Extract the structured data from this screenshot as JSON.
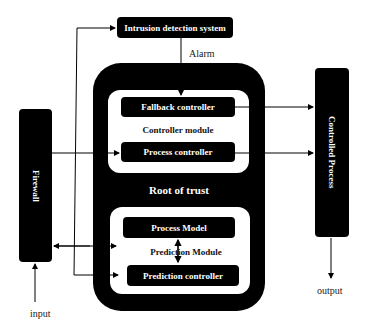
{
  "diagram": {
    "nodes": {
      "ids": {
        "label": "Intrusion detection system"
      },
      "alarm": {
        "label": "Alarm"
      },
      "root_of_trust": {
        "label": "Root of trust"
      },
      "controller_module": {
        "label": "Controller module"
      },
      "fallback_controller": {
        "label": "Fallback controller"
      },
      "process_controller": {
        "label": "Process controller"
      },
      "prediction_module": {
        "label": "Prediction Module"
      },
      "process_model": {
        "label": "Process Model"
      },
      "prediction_controller": {
        "label": "Prediction controller"
      },
      "firewall": {
        "label": "Firewall"
      },
      "controlled_process": {
        "label": "Controlled Process"
      },
      "input": {
        "label": "input"
      },
      "output": {
        "label": "output"
      }
    },
    "edges": [
      {
        "from": "input",
        "to": "firewall"
      },
      {
        "from": "firewall",
        "to": "process_controller"
      },
      {
        "from": "firewall",
        "to": "ids"
      },
      {
        "from": "firewall",
        "to": "prediction_controller"
      },
      {
        "from": "prediction_module",
        "to": "firewall"
      },
      {
        "from": "firewall",
        "to": "prediction_module"
      },
      {
        "from": "ids",
        "to": "fallback_controller",
        "label": "Alarm"
      },
      {
        "from": "fallback_controller",
        "to": "controlled_process"
      },
      {
        "from": "process_controller",
        "to": "controlled_process"
      },
      {
        "from": "process_model",
        "to": "prediction_controller",
        "bidirectional": true
      },
      {
        "from": "controlled_process",
        "to": "output"
      }
    ],
    "colors": {
      "block": "#000000",
      "background": "#ffffff",
      "block_text": "#ffffff"
    }
  }
}
